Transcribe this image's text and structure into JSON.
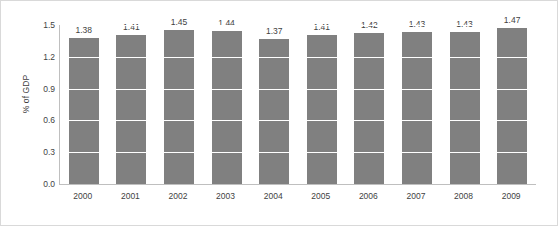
{
  "chart_data": {
    "type": "bar",
    "title": "",
    "xlabel": "",
    "ylabel": "% of GDP",
    "categories": [
      "2000",
      "2001",
      "2002",
      "2003",
      "2004",
      "2005",
      "2006",
      "2007",
      "2008",
      "2009"
    ],
    "values": [
      1.38,
      1.41,
      1.45,
      1.44,
      1.37,
      1.41,
      1.42,
      1.43,
      1.43,
      1.47
    ],
    "data_labels": [
      "1.38",
      "1.41",
      "1.45",
      "1.44",
      "1.37",
      "1.41",
      "1.42",
      "1.43",
      "1.43",
      "1.47"
    ],
    "ylim": [
      0.0,
      1.5
    ],
    "ytick_labels": [
      "0.0",
      "0.3",
      "0.6",
      "0.9",
      "1.2",
      "1.5"
    ],
    "ytick_values": [
      0.0,
      0.3,
      0.6,
      0.9,
      1.2,
      1.5
    ],
    "grid": true,
    "grid_color": "#ffffff",
    "legend": null,
    "bar_color": "#808080",
    "axis_color": "#bfbfbf",
    "text_color": "#3f3f3f",
    "frame_color": "#d9d9d9",
    "background": "#ffffff"
  }
}
